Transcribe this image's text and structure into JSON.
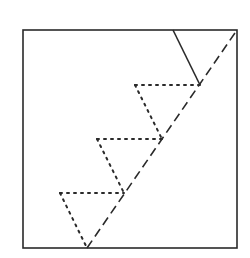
{
  "diagram": {
    "type": "geometric-construction",
    "colors": {
      "stroke": "#2a2a2a",
      "background": "#ffffff"
    },
    "frame": {
      "x": 23,
      "y": 30,
      "width": 214,
      "height": 218
    },
    "diagonal": {
      "style": "dashed",
      "x1": 87,
      "y1": 248,
      "x2": 237,
      "y2": 30
    },
    "solid_segment": {
      "style": "solid",
      "x1": 173,
      "y1": 30,
      "x2": 200,
      "y2": 85
    },
    "dotted_triangles": [
      {
        "apex_left": [
          135,
          85
        ],
        "right": [
          200,
          85
        ],
        "bottom": [
          162,
          139
        ]
      },
      {
        "apex_left": [
          97,
          139
        ],
        "right": [
          162,
          139
        ],
        "bottom": [
          124,
          193
        ]
      },
      {
        "apex_left": [
          60,
          193
        ],
        "right": [
          124,
          193
        ],
        "bottom": [
          87,
          248
        ]
      }
    ]
  }
}
